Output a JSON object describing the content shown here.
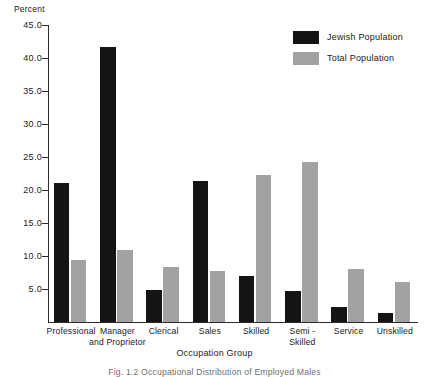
{
  "chart_data": {
    "type": "bar",
    "title": "",
    "xlabel": "Occupation Group",
    "ylabel": "Percent",
    "categories": [
      "Professional",
      "Manager\nand Proprietor",
      "Clerical",
      "Sales",
      "Skilled",
      "Semi -\nSkilled",
      "Service",
      "Unskilled"
    ],
    "series": [
      {
        "name": "Jewish Population",
        "color": "#141414",
        "values": [
          21.0,
          41.7,
          4.9,
          21.3,
          7.0,
          4.7,
          2.2,
          1.3
        ]
      },
      {
        "name": "Total Population",
        "color": "#a2a2a2",
        "values": [
          9.4,
          10.9,
          8.4,
          7.7,
          22.2,
          24.3,
          8.0,
          6.1
        ]
      }
    ],
    "ylim": [
      0.0,
      45.0
    ],
    "ytick_labels": [
      "45.0",
      "40.0",
      "35.0",
      "30.0",
      "25.0",
      "20.0",
      "15.0",
      "10.0",
      "5.0"
    ],
    "yticks": [
      45.0,
      40.0,
      35.0,
      30.0,
      25.0,
      20.0,
      15.0,
      10.0,
      5.0
    ],
    "grid": false,
    "legend_position": "top-right"
  },
  "legend": {
    "items": [
      {
        "label": "Jewish Population",
        "color": "#141414"
      },
      {
        "label": "Total Population",
        "color": "#a2a2a2"
      }
    ]
  },
  "caption": {
    "text": "Fig. 1.2  Occupational Distribution of Employed Males"
  }
}
